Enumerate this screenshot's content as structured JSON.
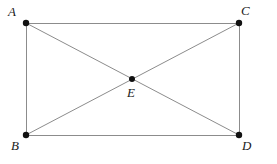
{
  "figure": {
    "type": "geometry-diagram",
    "width": 277,
    "height": 164,
    "background_color": "#ffffff",
    "line_color": "#8c8c8c",
    "line_width": 1,
    "point_color": "#111111",
    "point_size": 3.2,
    "label_color": "#1a1a1a",
    "points": [
      {
        "id": "A",
        "label": "A",
        "x": 26,
        "y": 23,
        "label_x": 8,
        "label_y": 5
      },
      {
        "id": "C",
        "label": "C",
        "x": 239,
        "y": 23,
        "label_x": 241,
        "label_y": 4
      },
      {
        "id": "B",
        "label": "B",
        "x": 26,
        "y": 135,
        "label_x": 11,
        "label_y": 139
      },
      {
        "id": "D",
        "label": "D",
        "x": 239,
        "y": 135,
        "label_x": 242,
        "label_y": 139
      },
      {
        "id": "E",
        "label": "E",
        "x": 132,
        "y": 79,
        "label_x": 127,
        "label_y": 86
      }
    ],
    "segments": [
      {
        "id": "AC",
        "from": "A",
        "to": "C",
        "role": "top-edge"
      },
      {
        "id": "AB",
        "from": "A",
        "to": "B",
        "role": "left-edge"
      },
      {
        "id": "CD",
        "from": "C",
        "to": "D",
        "role": "right-edge"
      },
      {
        "id": "BD",
        "from": "B",
        "to": "D",
        "role": "bottom-edge"
      },
      {
        "id": "AD",
        "from": "A",
        "to": "D",
        "role": "diagonal"
      },
      {
        "id": "BC",
        "from": "B",
        "to": "C",
        "role": "diagonal"
      }
    ]
  }
}
